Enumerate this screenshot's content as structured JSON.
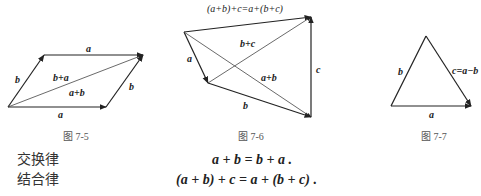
{
  "figures": [
    {
      "caption": "图 7-5",
      "labels": {
        "top_a": "a",
        "left_b": "b",
        "diag_upper": "b+a",
        "diag_lower": "a+b",
        "right_b": "b",
        "bottom_a": "a"
      }
    },
    {
      "caption": "图 7-6",
      "labels": {
        "title": "(a+b)+c=a+(b+c)",
        "a": "a",
        "b_plus_c": "b+c",
        "a_plus_b": "a+b",
        "c": "c",
        "b": "b"
      }
    },
    {
      "caption": "图 7-7",
      "labels": {
        "b": "b",
        "c": "c=a−b",
        "a": "a"
      }
    }
  ],
  "laws": [
    {
      "name": "交换律",
      "formula": "a + b = b + a ."
    },
    {
      "name": "结合律",
      "formula": "(a + b) + c = a + (b + c) ."
    }
  ]
}
